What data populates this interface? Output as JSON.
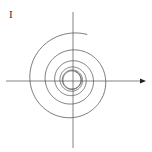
{
  "figure": {
    "panel_label": "I",
    "colors": {
      "stroke": "#555555",
      "background": "#ffffff"
    },
    "axes": {
      "origin": [
        73,
        81
      ],
      "x_axis": {
        "from": 6,
        "to": 145,
        "arrow": true
      },
      "y_axis": {
        "from": 12,
        "to": 148,
        "arrow": false
      }
    },
    "spiral": {
      "center": [
        72,
        80
      ],
      "start_radius": 48,
      "end_radius": 9,
      "turns": 6
    }
  }
}
